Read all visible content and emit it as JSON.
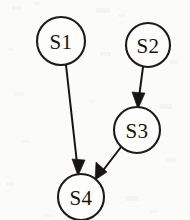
{
  "figure": {
    "kind": "directed-state-graph",
    "background_color": "#fbfbfa",
    "ink_color": "#171514",
    "node_fill": "#fdfdfc"
  },
  "nodes": [
    {
      "id": "s1",
      "label": "S1",
      "cx": 61,
      "cy": 41,
      "r": 24
    },
    {
      "id": "s2",
      "label": "S2",
      "cx": 148,
      "cy": 45,
      "r": 22
    },
    {
      "id": "s3",
      "label": "S3",
      "cx": 137,
      "cy": 130,
      "r": 23
    },
    {
      "id": "s4",
      "label": "S4",
      "cx": 81,
      "cy": 197,
      "r": 23
    }
  ],
  "edges": [
    {
      "id": "e1",
      "from": "S1",
      "to": "S4",
      "x1": 66,
      "y1": 65,
      "x2": 78,
      "y2": 172
    },
    {
      "id": "e2",
      "from": "S2",
      "to": "S3",
      "x1": 143,
      "y1": 67,
      "x2": 138,
      "y2": 105
    },
    {
      "id": "e3",
      "from": "S3",
      "to": "S4",
      "x1": 121,
      "y1": 147,
      "x2": 98,
      "y2": 177
    }
  ],
  "arrow_heads": [
    {
      "id": "a1",
      "edge": "e1",
      "points": "78,176 72,159 85,160"
    },
    {
      "id": "a2",
      "edge": "e2",
      "points": "138,109 132,92 145,93"
    },
    {
      "id": "a3",
      "edge": "e3",
      "points": "95,180 96,162 107,172"
    }
  ]
}
